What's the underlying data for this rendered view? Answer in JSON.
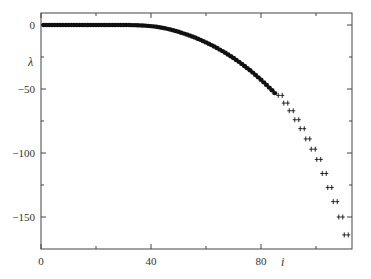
{
  "chart_data": {
    "type": "scatter",
    "title": "",
    "xlabel": "i",
    "ylabel": "λ",
    "xlim": [
      0,
      113
    ],
    "ylim": [
      -175,
      10
    ],
    "xticks": [
      0,
      40,
      80
    ],
    "xticks_minor": [
      20,
      60,
      100
    ],
    "yticks": [
      0,
      -50,
      -100,
      -150
    ],
    "yticks_minor": [
      -25,
      -75,
      -125
    ],
    "grid": false,
    "legend": null,
    "series": [
      {
        "name": "dots",
        "marker": "filled-circle",
        "x": [
          1,
          2,
          3,
          4,
          5,
          6,
          7,
          8,
          9,
          10,
          11,
          12,
          13,
          14,
          15,
          16,
          17,
          18,
          19,
          20,
          21,
          22,
          23,
          24,
          25,
          26,
          27,
          28,
          29,
          30,
          31,
          32,
          33,
          34,
          35,
          36,
          37,
          38,
          39,
          40,
          41,
          42,
          43,
          44,
          45,
          46,
          47,
          48,
          49,
          50,
          51,
          52,
          53,
          54,
          55,
          56,
          57,
          58,
          59,
          60,
          61,
          62,
          63,
          64,
          65,
          66,
          67,
          68,
          69,
          70,
          71,
          72,
          73,
          74,
          75,
          76,
          77,
          78,
          79,
          80,
          81,
          82,
          83,
          84,
          85
        ],
        "y": [
          0,
          0,
          0,
          0,
          0,
          0,
          0,
          0,
          0,
          0,
          0,
          0,
          0,
          0,
          0,
          0,
          0,
          0,
          0,
          0,
          0,
          0,
          0,
          0,
          0,
          0,
          0,
          0,
          0,
          0,
          0,
          0,
          -0.1,
          -0.1,
          -0.2,
          -0.3,
          -0.4,
          -0.5,
          -0.7,
          -0.9,
          -1.1,
          -1.4,
          -1.7,
          -2.1,
          -2.5,
          -3,
          -3.5,
          -4.1,
          -4.7,
          -5.3,
          -6,
          -6.7,
          -7.4,
          -8.2,
          -9,
          -9.8,
          -10.7,
          -11.6,
          -12.6,
          -13.6,
          -14.6,
          -15.7,
          -16.8,
          -18,
          -19.2,
          -20.4,
          -21.7,
          -23,
          -24.4,
          -25.8,
          -27.3,
          -28.8,
          -30.4,
          -32,
          -33.7,
          -35.4,
          -37.2,
          -39,
          -40.9,
          -42.8,
          -44.8,
          -46.8,
          -48.9,
          -51,
          -53.2
        ]
      },
      {
        "name": "crosses",
        "marker": "double-plus",
        "x": [
          87,
          89,
          91,
          93,
          95,
          97,
          99,
          101,
          103,
          105,
          107,
          109,
          111
        ],
        "y": [
          -55,
          -61,
          -67,
          -74,
          -81,
          -89,
          -97,
          -105,
          -116,
          -127,
          -138,
          -150,
          -164
        ]
      }
    ]
  },
  "axes": {
    "x_tick_labels": [
      "0",
      "40",
      "80"
    ],
    "y_tick_labels": [
      "0",
      "−50",
      "−100",
      "−150"
    ],
    "x_axis_label": "i",
    "y_axis_label": "λ"
  },
  "colors": {
    "marker": "#111111",
    "axis": "#444444"
  }
}
